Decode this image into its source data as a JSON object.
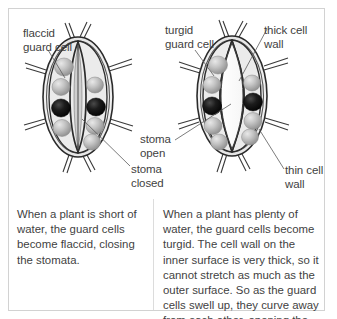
{
  "figure": {
    "border_color": "#d2d2d2",
    "background": "#ffffff",
    "text_color": "#3f3f3f"
  },
  "diagrams": {
    "left": {
      "name": "closed-stoma-diagram",
      "state": "closed",
      "chloroplast_count": 6,
      "nucleus_count": 2,
      "chloroplast_color": "#b4b4b4",
      "nucleus_color": "#111111",
      "cell_fill": "#ededed",
      "wall_color": "#2b2b2b"
    },
    "right": {
      "name": "open-stoma-diagram",
      "state": "open",
      "chloroplast_count": 6,
      "nucleus_count": 2,
      "chloroplast_color": "#b4b4b4",
      "nucleus_color": "#111111",
      "cell_fill": "#ededed",
      "wall_color": "#2b2b2b",
      "pore_fill": "#fdfdfd"
    }
  },
  "labels": {
    "flaccid_guard_cell": "flaccid\nguard cell",
    "turgid_guard_cell": "turgid\nguard cell",
    "thick_cell_wall": "thick cell wall",
    "stoma_open": "stoma\nopen",
    "stoma_closed": "stoma\nclosed",
    "thin_cell_wall": "thin cell\nwall"
  },
  "captions": {
    "left": "When a plant is short of water, the guard cells become flaccid, closing the stomata.",
    "right": "When a plant has plenty of water, the guard cells become turgid. The cell wall on the inner surface is very thick, so it cannot stretch as much as the outer surface. So as the guard cells swell up, they curve away from each other, opening the stoma."
  }
}
